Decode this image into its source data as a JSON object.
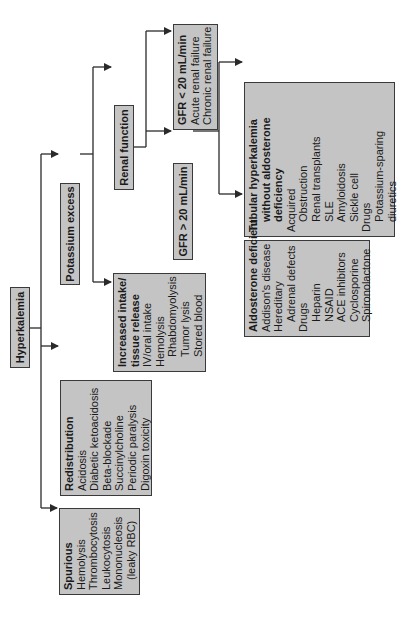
{
  "diagram": {
    "orientation": "rotated 90deg counterclockwise",
    "colors": {
      "box_fill": "#c4c4c4",
      "box_border": "#3a3a3a",
      "line": "#2a2a2a",
      "background": "#ffffff"
    },
    "root": {
      "label": "Hyperkalemia"
    },
    "potassium_excess": {
      "label": "Potassium excess"
    },
    "renal_function": {
      "label": "Renal function"
    },
    "gfr_low": {
      "title": "GFR < 20 mL/min",
      "items": [
        "Acute renal failure",
        "Chronic renal failure"
      ]
    },
    "gfr_high": {
      "label": "GFR > 20 mL/min"
    },
    "tubular": {
      "title_lines": [
        "Tubular hyperkalemia",
        "without aldosterone",
        "deficiency"
      ],
      "items": [
        {
          "text": "Acquired",
          "indent": 0
        },
        {
          "text": "Obstruction",
          "indent": 1
        },
        {
          "text": "Renal transplants",
          "indent": 1
        },
        {
          "text": "SLE",
          "indent": 1
        },
        {
          "text": "Amyloidosis",
          "indent": 1
        },
        {
          "text": "Sickle cell",
          "indent": 1
        },
        {
          "text": "Drugs",
          "indent": 0
        },
        {
          "text": "Potassium-sparing",
          "indent": 1
        },
        {
          "text": "diuretics",
          "indent": 1
        }
      ]
    },
    "aldosterone": {
      "title": "Aldosterone deficient",
      "items": [
        {
          "text": "Addison's disease",
          "indent": 0
        },
        {
          "text": "Hereditary",
          "indent": 0
        },
        {
          "text": "Adrenal defects",
          "indent": 1
        },
        {
          "text": "Drugs",
          "indent": 0
        },
        {
          "text": "Heparin",
          "indent": 1
        },
        {
          "text": "NSAID",
          "indent": 1
        },
        {
          "text": "ACE inhibitors",
          "indent": 1
        },
        {
          "text": "Cyclosporine",
          "indent": 1
        },
        {
          "text": "Spironolactone",
          "indent": 1
        }
      ]
    },
    "increased_intake": {
      "title_lines": [
        "Increased intake/",
        "tissue release"
      ],
      "items": [
        {
          "text": "IV/oral intake",
          "indent": 0
        },
        {
          "text": "Hemolysis",
          "indent": 0
        },
        {
          "text": "Rhabdomyolysis",
          "indent": 1
        },
        {
          "text": "Tumor lysis",
          "indent": 1
        },
        {
          "text": "Stored blood",
          "indent": 1
        }
      ]
    },
    "redistribution": {
      "title": "Redistribution",
      "items": [
        {
          "text": "Acidosis",
          "indent": 0
        },
        {
          "text": "Diabetic ketoacidosis",
          "indent": 0
        },
        {
          "text": "Beta-blockade",
          "indent": 0
        },
        {
          "text": "Succinylcholine",
          "indent": 0
        },
        {
          "text": "Periodic paralysis",
          "indent": 0
        },
        {
          "text": "Digoxin toxicity",
          "indent": 0
        }
      ]
    },
    "spurious": {
      "title": "Spurious",
      "items": [
        {
          "text": "Hemolysis",
          "indent": 0
        },
        {
          "text": "Thrombocytosis",
          "indent": 0
        },
        {
          "text": "Leukocytosis",
          "indent": 0
        },
        {
          "text": "Mononucleosis",
          "indent": 0
        },
        {
          "text": "(leaky RBC)",
          "indent": 1
        }
      ]
    }
  }
}
